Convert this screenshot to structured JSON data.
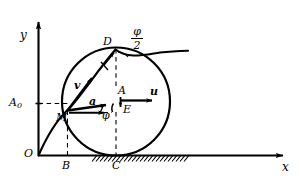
{
  "figure": {
    "background_color": "#ffffff",
    "ink_color": "#000000",
    "axes": {
      "x_label": "x",
      "y_label": "y",
      "origin_label": "O"
    },
    "points": [
      {
        "name": "point-M",
        "label": "M",
        "x": 67,
        "y": 110
      },
      {
        "name": "point-D",
        "label": "D",
        "x": 115,
        "y": 48
      },
      {
        "name": "point-A",
        "label": "A",
        "x": 122,
        "y": 93
      },
      {
        "name": "point-E",
        "label": "E",
        "x": 123,
        "y": 108
      },
      {
        "name": "point-B",
        "label": "B",
        "x": 67,
        "y": 155
      },
      {
        "name": "point-C",
        "label": "C",
        "x": 116,
        "y": 155
      }
    ],
    "vectors": [
      {
        "name": "velocity-vector",
        "label": "v"
      },
      {
        "name": "acceleration-vector",
        "label": "a"
      },
      {
        "name": "translation-velocity-vector",
        "label": "u"
      }
    ],
    "angles": [
      {
        "name": "angle-phi",
        "label": "φ"
      },
      {
        "name": "angle-phi-over-two-numerator",
        "label": "φ"
      },
      {
        "name": "angle-phi-over-two-denominator",
        "label": "2"
      }
    ],
    "ordinate": {
      "name": "ordinate-A0",
      "label": "A",
      "subscript": "0"
    },
    "ground": {
      "name": "ground-hatching",
      "hatch_count": 22
    },
    "circle": {
      "name": "rolling-wheel",
      "cx": 116,
      "cy": 101,
      "r": 54
    },
    "curve": {
      "name": "cycloid-trajectory"
    }
  }
}
